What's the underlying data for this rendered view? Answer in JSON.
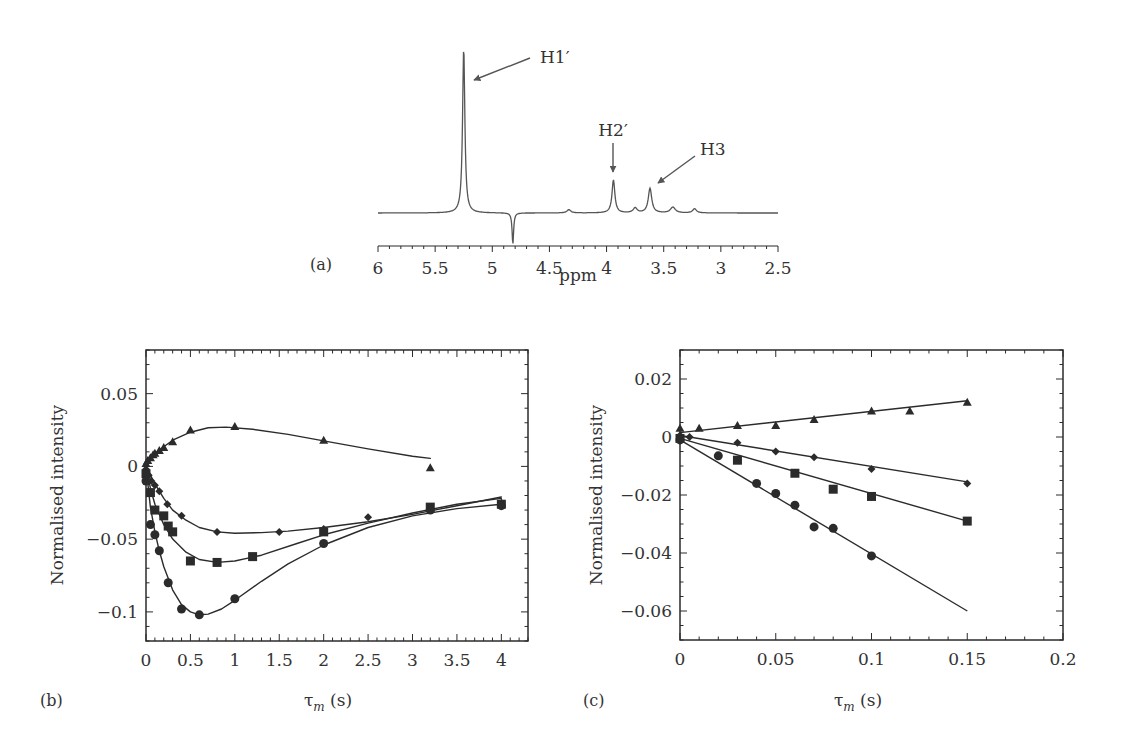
{
  "chart_data": [
    {
      "panel": "(a)",
      "type": "line",
      "title": "",
      "xlabel": "ppm",
      "ylabel": "",
      "xlim": [
        6,
        2.5
      ],
      "x_reversed": true,
      "xticks": [
        6,
        5.5,
        5,
        4.5,
        4,
        3.5,
        3,
        2.5
      ],
      "xtick_labels": [
        "6",
        "5.5",
        "5",
        "4.5",
        "4",
        "3.5",
        "3",
        "2.5"
      ],
      "grid": false,
      "peaks": [
        {
          "ppm": 5.25,
          "relative_height": 1.0,
          "width": 0.012,
          "sign": "positive"
        },
        {
          "ppm": 4.82,
          "relative_height": 0.19,
          "width": 0.008,
          "sign": "negative"
        },
        {
          "ppm": 4.33,
          "relative_height": 0.02,
          "width": 0.02,
          "sign": "positive"
        },
        {
          "ppm": 3.94,
          "relative_height": 0.2,
          "width": 0.015,
          "sign": "positive"
        },
        {
          "ppm": 3.75,
          "relative_height": 0.03,
          "width": 0.02,
          "sign": "positive"
        },
        {
          "ppm": 3.62,
          "relative_height": 0.15,
          "width": 0.018,
          "sign": "positive"
        },
        {
          "ppm": 3.42,
          "relative_height": 0.035,
          "width": 0.025,
          "sign": "positive"
        },
        {
          "ppm": 3.23,
          "relative_height": 0.025,
          "width": 0.02,
          "sign": "positive"
        }
      ],
      "annotations": [
        {
          "text": "H1′",
          "target_ppm": 5.25
        },
        {
          "text": "H2′",
          "target_ppm": 3.94
        },
        {
          "text": "H3",
          "target_ppm": 3.62
        }
      ]
    },
    {
      "panel": "(b)",
      "type": "scatter",
      "title": "",
      "xlabel": "τ",
      "xlabel_sub": "m",
      "xlabel_unit": " (s)",
      "ylabel": "Normalised intensity",
      "xlim": [
        0,
        4.3
      ],
      "ylim": [
        -0.12,
        0.08
      ],
      "xticks": [
        0,
        0.5,
        1,
        1.5,
        2,
        2.5,
        3,
        3.5,
        4
      ],
      "xtick_labels": [
        "0",
        "0.5",
        "1",
        "1.5",
        "2",
        "2.5",
        "3",
        "3.5",
        "4"
      ],
      "yticks": [
        0.05,
        0,
        -0.05,
        -0.1
      ],
      "ytick_labels": [
        "0.05",
        "0",
        "−0.05",
        "−0.1"
      ],
      "grid": false,
      "series": [
        {
          "name": "triangles",
          "marker": "triangle",
          "x": [
            0,
            0.02,
            0.05,
            0.08,
            0.1,
            0.15,
            0.2,
            0.3,
            0.5,
            1.0,
            2.0,
            3.2
          ],
          "y": [
            0.002,
            0.004,
            0.006,
            0.008,
            0.009,
            0.011,
            0.013,
            0.017,
            0.025,
            0.0275,
            0.018,
            -0.001
          ],
          "fit_x": [
            0,
            0.05,
            0.1,
            0.2,
            0.3,
            0.5,
            0.7,
            0.9,
            1.2,
            1.6,
            2.0,
            2.5,
            3.0,
            3.2
          ],
          "fit_y": [
            0,
            0.006,
            0.009,
            0.0135,
            0.018,
            0.0235,
            0.0265,
            0.027,
            0.0255,
            0.022,
            0.0175,
            0.012,
            0.007,
            0.0055
          ]
        },
        {
          "name": "diamonds",
          "marker": "diamond",
          "x": [
            0,
            0.03,
            0.06,
            0.1,
            0.15,
            0.24,
            0.4,
            0.8,
            1.5,
            2.0,
            2.5,
            3.2,
            4.0
          ],
          "y": [
            -0.002,
            -0.006,
            -0.01,
            -0.013,
            -0.017,
            -0.026,
            -0.034,
            -0.045,
            -0.045,
            -0.043,
            -0.035,
            -0.029,
            -0.025
          ],
          "fit_x": [
            0,
            0.1,
            0.2,
            0.3,
            0.45,
            0.6,
            0.8,
            1.0,
            1.3,
            1.6,
            2.0,
            2.5,
            3.0,
            3.5,
            4.0
          ],
          "fit_y": [
            0,
            -0.012,
            -0.022,
            -0.03,
            -0.037,
            -0.042,
            -0.045,
            -0.046,
            -0.0455,
            -0.0445,
            -0.042,
            -0.038,
            -0.033,
            -0.027,
            -0.021
          ]
        },
        {
          "name": "squares",
          "marker": "square",
          "x": [
            0,
            0.05,
            0.1,
            0.2,
            0.25,
            0.3,
            0.5,
            0.8,
            1.2,
            2.0,
            3.2,
            4.0
          ],
          "y": [
            -0.005,
            -0.018,
            -0.03,
            -0.034,
            -0.041,
            -0.045,
            -0.065,
            -0.066,
            -0.062,
            -0.045,
            -0.028,
            -0.026
          ],
          "fit_x": [
            0,
            0.05,
            0.1,
            0.2,
            0.3,
            0.45,
            0.6,
            0.8,
            1.0,
            1.3,
            1.7,
            2.0,
            2.5,
            3.0,
            3.5,
            4.0
          ],
          "fit_y": [
            0,
            -0.015,
            -0.026,
            -0.04,
            -0.05,
            -0.059,
            -0.064,
            -0.066,
            -0.065,
            -0.061,
            -0.053,
            -0.047,
            -0.039,
            -0.032,
            -0.026,
            -0.022
          ]
        },
        {
          "name": "circles",
          "marker": "circle",
          "x": [
            0,
            0.05,
            0.1,
            0.15,
            0.25,
            0.4,
            0.6,
            1.0,
            2.0,
            3.2,
            4.0
          ],
          "y": [
            -0.01,
            -0.04,
            -0.047,
            -0.058,
            -0.08,
            -0.098,
            -0.102,
            -0.091,
            -0.053,
            -0.03,
            -0.027
          ],
          "fit_x": [
            0,
            0.05,
            0.1,
            0.15,
            0.2,
            0.3,
            0.4,
            0.5,
            0.6,
            0.7,
            0.85,
            1.0,
            1.3,
            1.6,
            2.0,
            2.5,
            3.0,
            3.5,
            4.0
          ],
          "fit_y": [
            0,
            -0.028,
            -0.045,
            -0.058,
            -0.069,
            -0.085,
            -0.095,
            -0.1,
            -0.102,
            -0.1015,
            -0.098,
            -0.092,
            -0.079,
            -0.067,
            -0.054,
            -0.042,
            -0.034,
            -0.029,
            -0.026
          ]
        }
      ]
    },
    {
      "panel": "(c)",
      "type": "scatter",
      "title": "",
      "xlabel": "τ",
      "xlabel_sub": "m",
      "xlabel_unit": " (s)",
      "ylabel": "Normalised intensity",
      "xlim": [
        0,
        0.2
      ],
      "ylim": [
        -0.07,
        0.03
      ],
      "xticks": [
        0,
        0.05,
        0.1,
        0.15,
        0.2
      ],
      "xtick_labels": [
        "0",
        "0.05",
        "0.1",
        "0.15",
        "0.2"
      ],
      "yticks": [
        0.02,
        0,
        -0.02,
        -0.04,
        -0.06
      ],
      "ytick_labels": [
        "0.02",
        "0",
        "−0.02",
        "−0.04",
        "−0.06"
      ],
      "grid": false,
      "series": [
        {
          "name": "triangles",
          "marker": "triangle",
          "x": [
            0,
            0.01,
            0.03,
            0.05,
            0.07,
            0.1,
            0.12,
            0.15
          ],
          "y": [
            0.003,
            0.003,
            0.004,
            0.004,
            0.006,
            0.009,
            0.009,
            0.012
          ],
          "fit_x": [
            0,
            0.15
          ],
          "fit_y": [
            0.0015,
            0.0125
          ]
        },
        {
          "name": "diamonds",
          "marker": "diamond",
          "x": [
            0,
            0.005,
            0.03,
            0.05,
            0.07,
            0.1,
            0.15
          ],
          "y": [
            0.0005,
            0,
            -0.002,
            -0.005,
            -0.007,
            -0.011,
            -0.016
          ],
          "fit_x": [
            0,
            0.15
          ],
          "fit_y": [
            0.0005,
            -0.0155
          ]
        },
        {
          "name": "squares",
          "marker": "square",
          "x": [
            0,
            0.03,
            0.06,
            0.08,
            0.1,
            0.15
          ],
          "y": [
            -0.0005,
            -0.008,
            -0.0125,
            -0.018,
            -0.0205,
            -0.029
          ],
          "fit_x": [
            0,
            0.15
          ],
          "fit_y": [
            -0.0005,
            -0.029
          ]
        },
        {
          "name": "circles",
          "marker": "circle",
          "x": [
            0,
            0.02,
            0.04,
            0.05,
            0.06,
            0.07,
            0.08,
            0.1
          ],
          "y": [
            -0.001,
            -0.0065,
            -0.016,
            -0.0195,
            -0.0235,
            -0.031,
            -0.0315,
            -0.041
          ],
          "fit_x": [
            0,
            0.15
          ],
          "fit_y": [
            -0.001,
            -0.06
          ]
        }
      ]
    }
  ],
  "colors": {
    "ink": "#2b2b2b",
    "spectrum": "#555555",
    "arrow": "#555555"
  }
}
